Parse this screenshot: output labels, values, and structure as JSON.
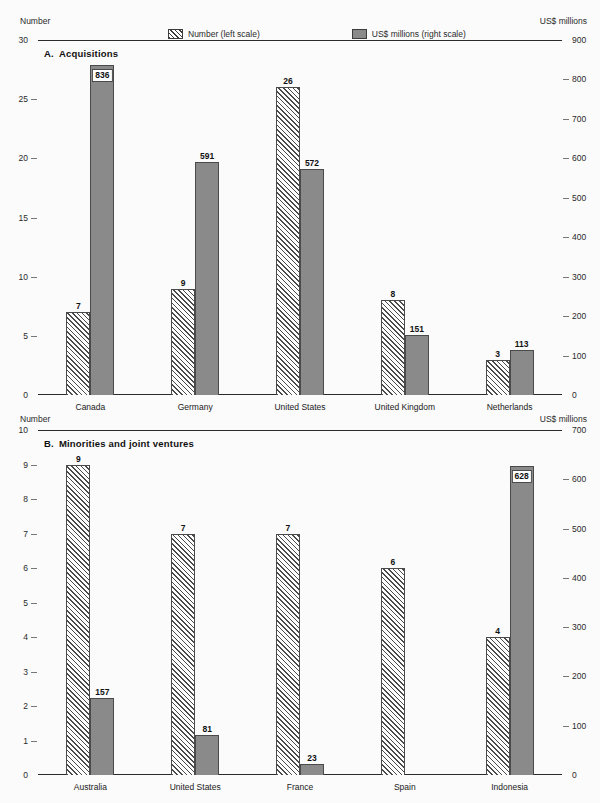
{
  "legend": {
    "items": [
      {
        "label": "Number (left scale)",
        "swatch": "hatched-swatch"
      },
      {
        "label": "US$ millions (right scale)",
        "swatch": "solid-grey-swatch"
      }
    ]
  },
  "panel_a": {
    "title_letter": "A.",
    "title_text": "Acquisitions",
    "left_caption": "Number",
    "right_caption": "US$ millions"
  },
  "panel_b": {
    "title_letter": "B.",
    "title_text": "Minorities and joint ventures",
    "left_caption": "Number",
    "right_caption": "US$ millions"
  },
  "chart_data": [
    {
      "type": "bar",
      "title": "A. Acquisitions",
      "panel": "A",
      "categories": [
        "Canada",
        "Germany",
        "United States",
        "United Kingdom",
        "Netherlands"
      ],
      "series": [
        {
          "name": "Number (left scale)",
          "axis": "left",
          "values": [
            7,
            9,
            26,
            8,
            3
          ]
        },
        {
          "name": "US$ millions (right scale)",
          "axis": "right",
          "values": [
            836,
            591,
            572,
            151,
            113
          ]
        }
      ],
      "left_axis": {
        "label": "Number",
        "ylim": [
          0,
          30
        ],
        "ticks": [
          0,
          5,
          10,
          15,
          20,
          25,
          30
        ],
        "tick_labels": [
          "0",
          "5",
          "10",
          "15",
          "20",
          "25",
          "30"
        ]
      },
      "right_axis": {
        "label": "US$ millions",
        "ylim": [
          0,
          900
        ],
        "ticks": [
          0,
          100,
          200,
          300,
          400,
          500,
          600,
          700,
          800,
          900
        ],
        "tick_labels": [
          "0",
          "100",
          "200",
          "300",
          "400",
          "500",
          "600",
          "700",
          "800",
          "900"
        ]
      },
      "grid": false,
      "legend_position": "top"
    },
    {
      "type": "bar",
      "title": "B. Minorities and joint ventures",
      "panel": "B",
      "categories": [
        "Australia",
        "United States",
        "France",
        "Spain",
        "Indonesia"
      ],
      "series": [
        {
          "name": "Number (left scale)",
          "axis": "left",
          "values": [
            9,
            7,
            7,
            6,
            4
          ]
        },
        {
          "name": "US$ millions (right scale)",
          "axis": "right",
          "values": [
            157,
            81,
            23,
            0,
            628
          ]
        }
      ],
      "left_axis": {
        "label": "Number",
        "ylim": [
          0,
          10
        ],
        "ticks": [
          0,
          1,
          2,
          3,
          4,
          5,
          6,
          7,
          8,
          9,
          10
        ],
        "tick_labels": [
          "0",
          "1",
          "2",
          "3",
          "4",
          "5",
          "6",
          "7",
          "8",
          "9",
          "10"
        ]
      },
      "right_axis": {
        "label": "US$ millions",
        "ylim": [
          0,
          700
        ],
        "ticks": [
          0,
          100,
          200,
          300,
          400,
          500,
          600,
          700
        ],
        "tick_labels": [
          "0",
          "100",
          "200",
          "300",
          "400",
          "500",
          "600",
          "700"
        ]
      },
      "grid": false,
      "legend_position": "top"
    }
  ],
  "colors": {
    "solid_bar": "#8a8a8a",
    "bar_outline": "#4a4a4a",
    "axis": "#2a2a2a",
    "background": "#fbfbfb"
  }
}
